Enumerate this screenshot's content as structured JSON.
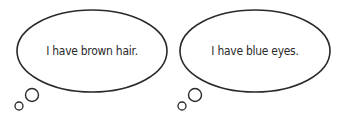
{
  "bubbles": [
    {
      "text": "I have brown hair.",
      "type": "thought-bubble"
    },
    {
      "text": "I have blue eyes.",
      "type": "thought-bubble"
    }
  ],
  "colors": {
    "stroke": "#2a2a2a",
    "fill": "#ffffff",
    "text": "#2a2a2a"
  }
}
